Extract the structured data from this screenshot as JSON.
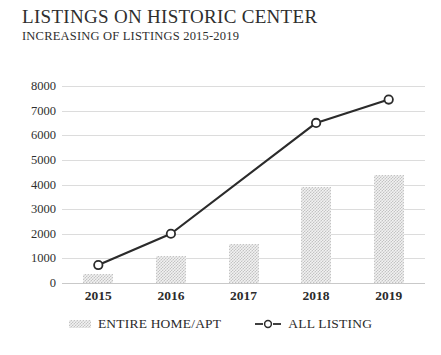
{
  "header": {
    "title": "LISTINGS ON HISTORIC CENTER",
    "subtitle": "INCREASING OF LISTINGS 2015-2019"
  },
  "chart_data": {
    "type": "bar",
    "title": "LISTINGS ON HISTORIC CENTER",
    "subtitle": "INCREASING OF LISTINGS 2015-2019",
    "xlabel": "",
    "ylabel": "",
    "categories": [
      "2015",
      "2016",
      "2017",
      "2018",
      "2019"
    ],
    "series": [
      {
        "name": "ENTIRE HOME/APT",
        "type": "bar",
        "values": [
          370,
          1100,
          1600,
          3900,
          4400
        ]
      },
      {
        "name": "ALL LISTING",
        "type": "line",
        "marker": "circle-open",
        "values": [
          730,
          2000,
          null,
          6500,
          7450
        ]
      }
    ],
    "ylim": [
      0,
      8000
    ],
    "yticks": [
      0,
      1000,
      2000,
      3000,
      4000,
      5000,
      6000,
      7000,
      8000
    ],
    "ytick_labels": [
      "0",
      "1000",
      "2000",
      "3000",
      "4000",
      "5000",
      "6000",
      "7000",
      "8000"
    ],
    "grid": true,
    "legend_position": "bottom",
    "colors": {
      "bar_fill": "#f2f2f2",
      "bar_hatch": "#c3c3c3",
      "line": "#2b2b2b",
      "marker_face": "#ffffff",
      "gridline": "#dcdcdc",
      "text": "#2b2b2b"
    }
  },
  "legend": {
    "items": [
      {
        "label": "ENTIRE HOME/APT",
        "marker": "hatched-bar-swatch"
      },
      {
        "label": "ALL LISTING",
        "marker": "line-circle-swatch"
      }
    ]
  }
}
